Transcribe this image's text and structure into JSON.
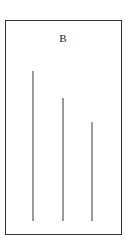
{
  "figure": {
    "label": "B",
    "line_color": "#9a9a9a",
    "frame_color": "#333333"
  },
  "lines": [
    {
      "id": "line-1",
      "x": 33,
      "top": 71,
      "bottom": 221
    },
    {
      "id": "line-2",
      "x": 63,
      "top": 98,
      "bottom": 221
    },
    {
      "id": "line-3",
      "x": 92,
      "top": 122,
      "bottom": 221
    }
  ]
}
